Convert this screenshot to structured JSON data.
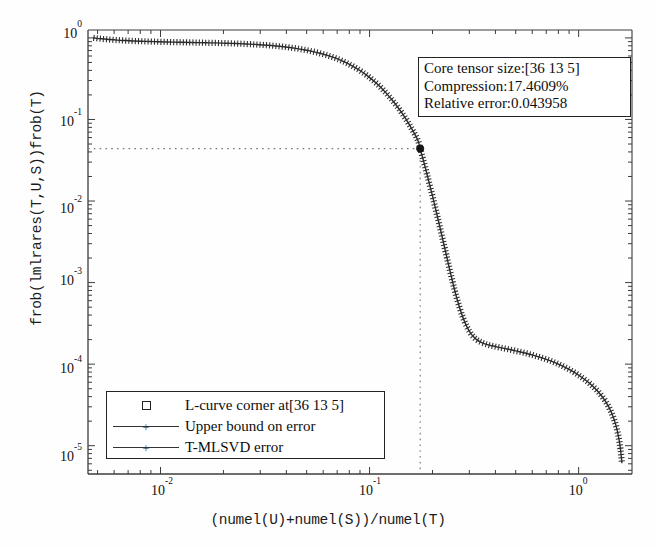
{
  "axes": {
    "xlabel": "(numel(U)+numel(S))/numel(T)",
    "ylabel": "frob(lmlrares(T,U,S))frob(T)",
    "xticks": [
      "10-2",
      "10-1",
      "100"
    ],
    "yticks": [
      "100",
      "10-1",
      "10-2",
      "10-3",
      "10-4",
      "10-5"
    ]
  },
  "ytick_labels": {
    "t0": "10",
    "t0e": "0",
    "t1": "10",
    "t1e": "-1",
    "t2": "10",
    "t2e": "-2",
    "t3": "10",
    "t3e": "-3",
    "t4": "10",
    "t4e": "-4",
    "t5": "10",
    "t5e": "-5"
  },
  "xtick_labels": {
    "t0": "10",
    "t0e": "-2",
    "t1": "10",
    "t1e": "-1",
    "t2": "10",
    "t2e": "0"
  },
  "infobox": {
    "core_tensor_size": "Core tensor size:[36 13 5]",
    "compression": "Compression:17.4609%",
    "relative_error": "Relative error:0.043958"
  },
  "legend": {
    "items": [
      {
        "label": "L-curve corner at[36 13 5]",
        "symbol": "square-marker"
      },
      {
        "label": "Upper bound on error",
        "symbol": "line-plus-marker"
      },
      {
        "label": "T-MLSVD error",
        "symbol": "line-plus-marker"
      }
    ]
  },
  "colors": {
    "curve": "#2b2b2b",
    "axis": "#3c3c3c",
    "guide": "#777777",
    "marker": "#151515"
  },
  "chart_data": {
    "type": "line",
    "title": "",
    "xlabel": "(numel(U)+numel(S))/numel(T)",
    "ylabel": "frob(lmlrares(T,U,S))frob(T)",
    "xscale": "log",
    "yscale": "log",
    "xlim": [
      0.0045,
      1.8
    ],
    "ylim": [
      4.5e-06,
      1.25
    ],
    "grid": false,
    "legend_position": "lower-left",
    "annotations": [
      {
        "text": "Core tensor size:[36 13 5]",
        "position": "upper-right"
      },
      {
        "text": "Compression:17.4609%",
        "position": "upper-right"
      },
      {
        "text": "Relative error:0.043958",
        "position": "upper-right"
      }
    ],
    "corner_point": {
      "x": 0.174609,
      "y": 0.043958,
      "label": "L-curve corner at[36 13 5]"
    },
    "guide_lines": [
      {
        "orientation": "horizontal",
        "y": 0.043958,
        "style": "dotted"
      },
      {
        "orientation": "vertical",
        "x": 0.174609,
        "style": "dotted"
      }
    ],
    "series": [
      {
        "name": "T-MLSVD error",
        "marker": "+",
        "x": [
          0.0048,
          0.0052,
          0.0057,
          0.0062,
          0.0068,
          0.0074,
          0.0081,
          0.0089,
          0.0097,
          0.0106,
          0.0116,
          0.0127,
          0.0139,
          0.0152,
          0.0166,
          0.0181,
          0.0198,
          0.0217,
          0.0237,
          0.0259,
          0.0283,
          0.031,
          0.0339,
          0.0371,
          0.0405,
          0.0443,
          0.0485,
          0.053,
          0.058,
          0.0634,
          0.0693,
          0.0758,
          0.0829,
          0.0907,
          0.0992,
          0.1085,
          0.1186,
          0.1297,
          0.1419,
          0.1552,
          0.1697,
          0.1746,
          0.18,
          0.186,
          0.1925,
          0.1995,
          0.207,
          0.215,
          0.2235,
          0.2325,
          0.242,
          0.252,
          0.2625,
          0.2735,
          0.285,
          0.297,
          0.31,
          0.325,
          0.342,
          0.362,
          0.385,
          0.41,
          0.44,
          0.475,
          0.515,
          0.56,
          0.61,
          0.67,
          0.74,
          0.82,
          0.91,
          1.01,
          1.12,
          1.24,
          1.35,
          1.44,
          1.51,
          1.56,
          1.59,
          1.61
        ],
        "y": [
          1.0,
          0.975,
          0.955,
          0.94,
          0.928,
          0.918,
          0.91,
          0.903,
          0.897,
          0.892,
          0.888,
          0.884,
          0.88,
          0.876,
          0.872,
          0.868,
          0.863,
          0.857,
          0.85,
          0.842,
          0.832,
          0.82,
          0.806,
          0.789,
          0.769,
          0.745,
          0.717,
          0.685,
          0.648,
          0.606,
          0.56,
          0.508,
          0.452,
          0.393,
          0.333,
          0.274,
          0.218,
          0.167,
          0.123,
          0.086,
          0.0565,
          0.043958,
          0.033,
          0.024,
          0.017,
          0.0118,
          0.008,
          0.0053,
          0.00345,
          0.00222,
          0.00142,
          0.00092,
          0.00062,
          0.00044,
          0.00033,
          0.000265,
          0.000225,
          0.0002,
          0.000185,
          0.000175,
          0.000168,
          0.000162,
          0.000156,
          0.00015,
          0.000143,
          0.000136,
          0.000128,
          0.000119,
          0.000109,
          9.75e-05,
          8.5e-05,
          7.2e-05,
          5.9e-05,
          4.6e-05,
          3.45e-05,
          2.5e-05,
          1.75e-05,
          1.2e-05,
          8.5e-06,
          6.2e-06
        ]
      },
      {
        "name": "Upper bound on error",
        "marker": "+",
        "note": "overlaps T-MLSVD error curve"
      }
    ]
  }
}
